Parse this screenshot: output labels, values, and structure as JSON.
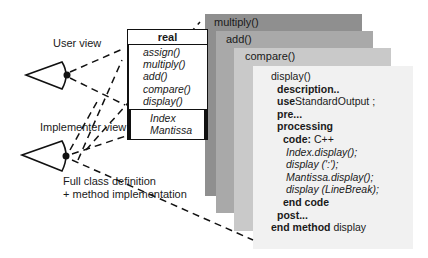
{
  "labels": {
    "user_view": "User view",
    "implementer_view": "Implementer view",
    "full_def_line1": "Full class definition",
    "full_def_line2": "+ method implementation"
  },
  "class_box": {
    "name": "real",
    "methods": [
      "assign()",
      "multiply()",
      "add()",
      "compare()",
      "display()"
    ],
    "attributes": [
      "Index",
      "Mantissa"
    ]
  },
  "layers": [
    {
      "title": "multiply()",
      "color": "#8f8f8f"
    },
    {
      "title": "add()",
      "color": "#a9a9a9"
    },
    {
      "title": "compare()",
      "color": "#c9c9c9"
    },
    {
      "title": "display()",
      "color": "#f1f1f1"
    }
  ],
  "display_code": {
    "title": "display()",
    "description": "description..",
    "use_kw": "use",
    "use_val": "StandardOutput ;",
    "pre": "pre...",
    "processing": "processing",
    "code_kw": "code:",
    "code_lang": " C++",
    "lines": [
      "Index.display();",
      "display (':');",
      "Mantissa.display();",
      "display (LineBreak);"
    ],
    "end_code": "end code",
    "post": "post...",
    "end_method_kw": "end method",
    "end_method_name": " display"
  }
}
